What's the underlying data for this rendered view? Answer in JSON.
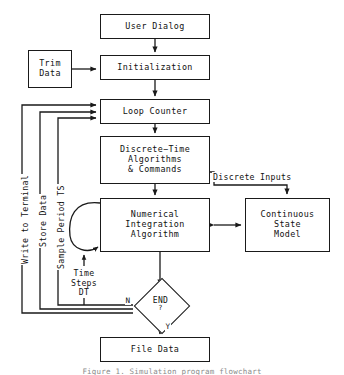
{
  "diagram": {
    "title": "Simulation Program Flowchart",
    "caption": "Figure 1. Simulation program flowchart",
    "line_color": "#1a1a1a",
    "background": "#ffffff",
    "nodes": [
      {
        "id": "user-dialog",
        "label": "User Dialog",
        "lines": [
          "User Dialog"
        ],
        "shape": "rect"
      },
      {
        "id": "trim-data",
        "label": "Trim Data",
        "lines": [
          "Trim",
          "Data"
        ],
        "shape": "rect"
      },
      {
        "id": "initialization",
        "label": "Initialization",
        "lines": [
          "Initialization"
        ],
        "shape": "rect"
      },
      {
        "id": "loop-counter",
        "label": "Loop Counter",
        "lines": [
          "Loop Counter"
        ],
        "shape": "rect"
      },
      {
        "id": "discrete-time",
        "label": "Discrete-Time Algorithms & Commands",
        "lines": [
          "Discrete−Time",
          "Algorithms",
          "& Commands"
        ],
        "shape": "rect"
      },
      {
        "id": "numerical-integration",
        "label": "Numerical Integration Algorithm",
        "lines": [
          "Numerical",
          "Integration",
          "Algorithm"
        ],
        "shape": "rect"
      },
      {
        "id": "continuous-state",
        "label": "Continuous State Model",
        "lines": [
          "Continuous",
          "State",
          "Model"
        ],
        "shape": "rect"
      },
      {
        "id": "end-decision",
        "label": "END ?",
        "text": "END",
        "question": "?",
        "shape": "diamond"
      },
      {
        "id": "file-data",
        "label": "File Data",
        "lines": [
          "File Data"
        ],
        "shape": "rect"
      }
    ],
    "edge_labels": {
      "discrete_inputs": "Discrete Inputs",
      "write_to_terminal": "Write to Terminal",
      "store_data": "Store Data",
      "sample_period": "Sample Period TS",
      "time_steps": [
        "Time",
        "Steps",
        "DT"
      ],
      "branch_no": "N",
      "branch_yes": "Y"
    }
  }
}
